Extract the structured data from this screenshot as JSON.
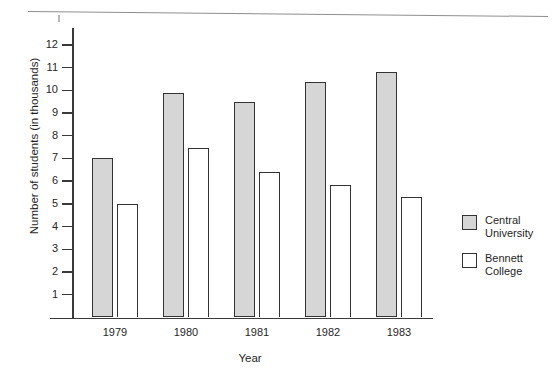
{
  "page": {
    "top_clipped_text": "",
    "top_rule": "horizontal-rule"
  },
  "chart_data": {
    "type": "bar",
    "title": "",
    "xlabel": "Year",
    "ylabel": "Number of students (in thousands)",
    "categories": [
      "1979",
      "1980",
      "1981",
      "1982",
      "1983"
    ],
    "series": [
      {
        "name": "Central University",
        "values": [
          7.0,
          9.9,
          9.5,
          10.35,
          10.8
        ],
        "color": "#d6d6d6"
      },
      {
        "name": "Bennett College",
        "values": [
          5.0,
          7.45,
          6.4,
          5.85,
          5.3
        ],
        "color": "#ffffff"
      }
    ],
    "ylim": [
      0,
      12.6
    ],
    "yticks": [
      1,
      2,
      3,
      4,
      5,
      6,
      7,
      8,
      9,
      10,
      11,
      12
    ],
    "ytick_labels": [
      "1",
      "2",
      "3",
      "4",
      "5",
      "6",
      "7",
      "8",
      "9",
      "10",
      "11",
      "12"
    ],
    "grid": false,
    "legend_position": "right"
  },
  "legend": {
    "entries": [
      {
        "line1": "Central",
        "line2": "University",
        "swatch": "filled"
      },
      {
        "line1": "Bennett",
        "line2": "College",
        "swatch": "empty"
      }
    ]
  }
}
